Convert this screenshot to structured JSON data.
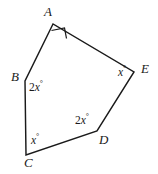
{
  "figure": {
    "type": "geometry-diagram",
    "shape": "pentagon",
    "stroke_color": "#1a1a1a",
    "background_color": "#ffffff",
    "width": 158,
    "height": 174,
    "vertices": [
      {
        "id": "A",
        "label": "A",
        "x": 53,
        "y": 24,
        "label_x": 45,
        "label_y": 6,
        "angle_mark": "right-angle-square"
      },
      {
        "id": "B",
        "label": "B",
        "x": 25,
        "y": 81,
        "label_x": 12,
        "label_y": 72,
        "angle_text": "2x",
        "angle_unit": "°"
      },
      {
        "id": "C",
        "label": "C",
        "x": 26,
        "y": 155,
        "label_x": 24,
        "label_y": 157,
        "angle_text": "x",
        "angle_unit": "°"
      },
      {
        "id": "D",
        "label": "D",
        "x": 97,
        "y": 131,
        "label_x": 99,
        "label_y": 134,
        "angle_text": "2x",
        "angle_unit": "°"
      },
      {
        "id": "E",
        "label": "E",
        "x": 134,
        "y": 72,
        "label_x": 142,
        "label_y": 63,
        "angle_text": "x",
        "angle_unit": "°"
      }
    ],
    "angle_labels": [
      {
        "at": "B",
        "number": "2",
        "variable": "x",
        "degree": "°",
        "text": "2x°",
        "x": 29,
        "y": 81
      },
      {
        "at": "C",
        "number": "",
        "variable": "x",
        "degree": "°",
        "text": "x°",
        "x": 31,
        "y": 134
      },
      {
        "at": "D",
        "number": "2",
        "variable": "x",
        "degree": "°",
        "text": "2x°",
        "x": 75,
        "y": 114
      },
      {
        "at": "E",
        "number": "",
        "variable": "x",
        "degree": "°",
        "text": "x°",
        "x": 118,
        "y": 66
      }
    ],
    "path_points": "53,24 25,81 26,155 97,131 134,72",
    "right_angle_mark_points": "51.5,30.5 64.5,28.0 66.5,38.5"
  }
}
